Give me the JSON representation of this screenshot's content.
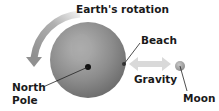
{
  "diagram": {
    "title": "Earth's rotation",
    "labels": {
      "rotation": "Earth's rotation",
      "beach": "Beach",
      "gravity": "Gravity",
      "moon": "Moon",
      "north_pole_line1": "North",
      "north_pole_line2": "Pole"
    },
    "colors": {
      "earth": "#8a8a8a",
      "rotation_arrow": "#a8a8a8",
      "gravity_arrow": "#d9d9d9",
      "moon": "#a0a0a0",
      "text": "#1a1a1a"
    }
  }
}
